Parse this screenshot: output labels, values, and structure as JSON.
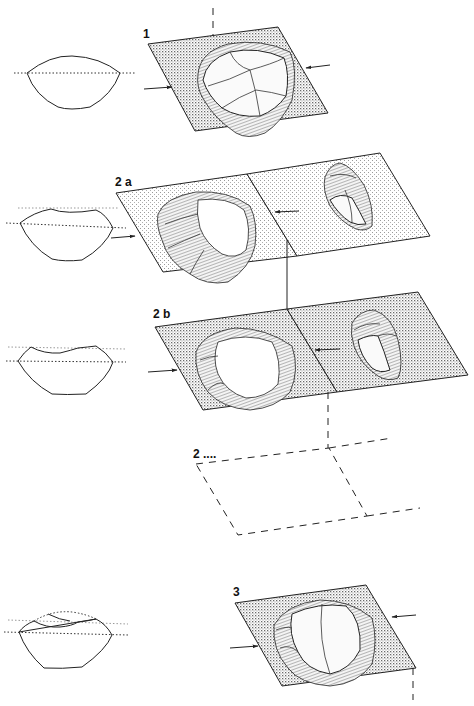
{
  "figure": {
    "stages": [
      {
        "id": "1",
        "label": "1",
        "description": "Prepared core on plane, striking direction arrows"
      },
      {
        "id": "2a",
        "label": "2 a",
        "description": "First preferential flake removed (flake shown to the right)"
      },
      {
        "id": "2b",
        "label": "2 b",
        "description": "Second preferential flake removed (flake shown to the right)"
      },
      {
        "id": "2n",
        "label": "2 ....",
        "description": "Further removals (dashed, implied plane)"
      },
      {
        "id": "3",
        "label": "3",
        "description": "Exhausted core on plane"
      }
    ],
    "profiles": [
      {
        "stage": "1",
        "shape": "lens profile with dotted plane line"
      },
      {
        "stage": "2a",
        "shape": "profile with concave top after first removal"
      },
      {
        "stage": "2b",
        "shape": "profile with deeper concave top after second removal"
      },
      {
        "stage": "3",
        "shape": "profile with overlapping scars, dashed original outline"
      }
    ],
    "colors": {
      "ink": "#222222",
      "background": "#ffffff",
      "stipple": "#9a9a9a"
    }
  }
}
